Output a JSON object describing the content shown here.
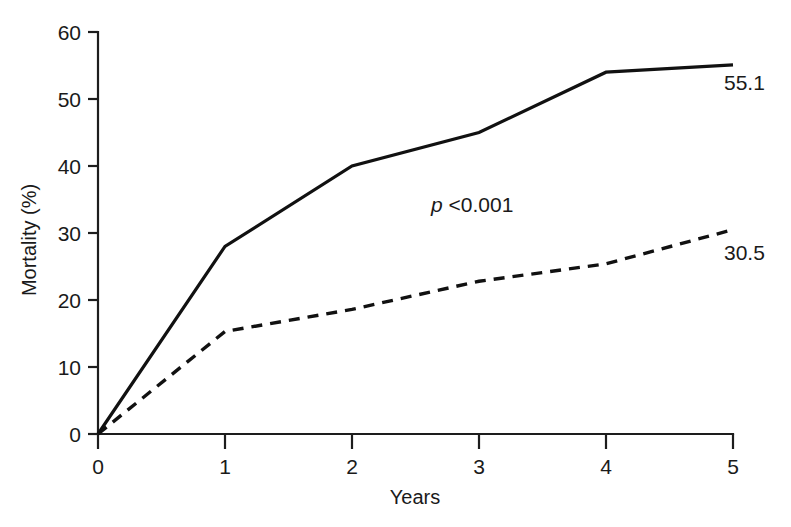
{
  "chart_data": {
    "type": "line",
    "title": "",
    "xlabel": "Years",
    "ylabel": "Mortality (%)",
    "x": [
      0,
      1,
      2,
      3,
      4,
      5
    ],
    "xlim": [
      0,
      5
    ],
    "ylim": [
      0,
      60
    ],
    "xticks": [
      "0",
      "1",
      "2",
      "3",
      "4",
      "5"
    ],
    "yticks": [
      "0",
      "10",
      "20",
      "30",
      "40",
      "50",
      "60"
    ],
    "grid": false,
    "legend": "none",
    "series": [
      {
        "name": "solid-curve",
        "style": "solid",
        "values": [
          0,
          28.0,
          40.0,
          45.0,
          54.0,
          55.1
        ],
        "end_label": "55.1"
      },
      {
        "name": "dashed-curve",
        "style": "dashed",
        "values": [
          0,
          15.3,
          18.6,
          22.8,
          25.4,
          30.5
        ],
        "end_label": "30.5"
      }
    ],
    "annotations": [
      {
        "name": "p-value",
        "italic_part": "p",
        "text": " <0.001",
        "x_value": 2.6,
        "y_value": 33.5
      }
    ],
    "colors": {
      "axis": "#1d1d1d",
      "series": "#111111",
      "background": "#ffffff"
    }
  }
}
